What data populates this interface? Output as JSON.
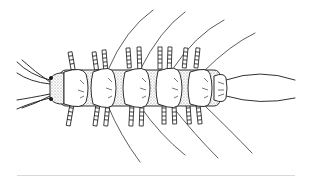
{
  "figure": {
    "stroke_color": "#1a1a1a",
    "shade_color": "#9a9a9a",
    "background": "#ffffff",
    "divider_color": "#d8d8d8"
  }
}
